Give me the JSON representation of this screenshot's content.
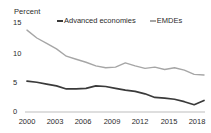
{
  "chart_data": {
    "type": "line",
    "title": "",
    "subtitle": "",
    "ylabel": "Percent",
    "xlabel": "",
    "ylim": [
      0,
      15
    ],
    "xlim": [
      2000,
      2018
    ],
    "grid": false,
    "legend_position": "top",
    "yticks": [
      "0",
      "5",
      "10",
      "15"
    ],
    "ytick_values": [
      0,
      5,
      10,
      15
    ],
    "xticks": [
      "2000",
      "2003",
      "2006",
      "2009",
      "2012",
      "2015",
      "2018"
    ],
    "xtick_values": [
      2000,
      2003,
      2006,
      2009,
      2012,
      2015,
      2018
    ],
    "x": [
      2000,
      2001,
      2002,
      2003,
      2004,
      2005,
      2006,
      2007,
      2008,
      2009,
      2010,
      2011,
      2012,
      2013,
      2014,
      2015,
      2016,
      2017,
      2018
    ],
    "series": [
      {
        "name": "Advanced economies",
        "color": "#3a3a3a",
        "values": [
          5.1,
          4.9,
          4.6,
          4.3,
          3.8,
          3.8,
          3.9,
          4.3,
          4.2,
          3.9,
          3.6,
          3.4,
          3.0,
          2.4,
          2.3,
          2.1,
          1.7,
          1.2,
          1.9
        ]
      },
      {
        "name": "EMDEs",
        "color": "#a6a6a6",
        "values": [
          13.5,
          12.2,
          11.3,
          10.4,
          9.2,
          8.7,
          8.2,
          7.6,
          7.3,
          7.4,
          8.1,
          7.6,
          7.2,
          7.4,
          7.0,
          7.3,
          6.9,
          6.2,
          6.1
        ]
      }
    ]
  }
}
